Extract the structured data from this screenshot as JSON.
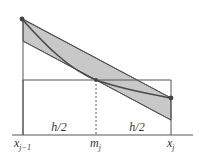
{
  "figure": {
    "type": "midpoint-rule-error-diagram",
    "labels": {
      "left_half": "h/2",
      "right_half": "h/2",
      "x_left": "x",
      "x_left_sub": "j−1",
      "midpoint": "m",
      "midpoint_sub": "j",
      "x_right": "x",
      "x_right_sub": "j"
    },
    "colors": {
      "band_fill": "#c8c8c8",
      "line": "#4a4a4a",
      "curve": "#555555",
      "point": "#444444"
    }
  }
}
